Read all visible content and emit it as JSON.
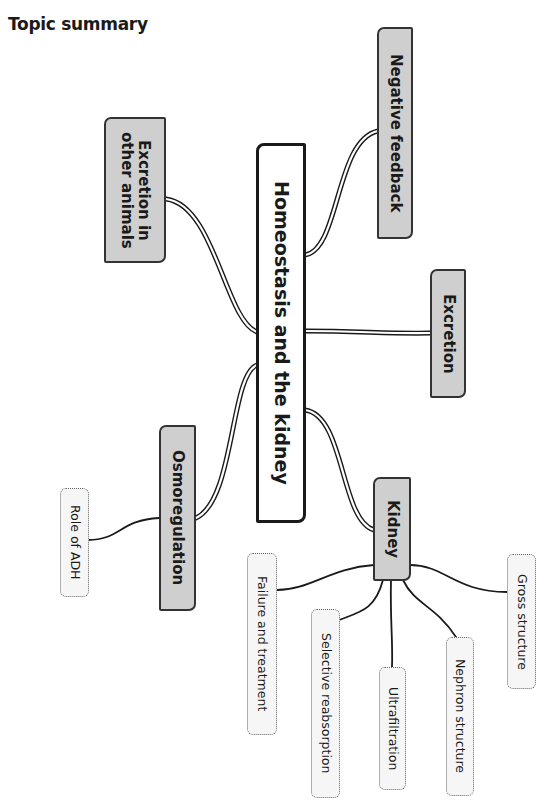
{
  "page": {
    "title": "Topic summary"
  },
  "mindmap": {
    "center": {
      "label": "Homeostasis and the kidney"
    },
    "branches": {
      "negative_feedback": {
        "label": "Negative feedback"
      },
      "excretion_other_animals": {
        "label": "Excretion in other animals",
        "line1": "Excretion in",
        "line2": "other animals"
      },
      "excretion": {
        "label": "Excretion"
      },
      "osmoregulation": {
        "label": "Osmoregulation",
        "children": [
          {
            "label": "Role of ADH"
          }
        ]
      },
      "kidney": {
        "label": "Kidney",
        "children": [
          {
            "label": "Failure and treatment"
          },
          {
            "label": "Selective reabsorption"
          },
          {
            "label": "Ultrafiltration"
          },
          {
            "label": "Nephron structure"
          },
          {
            "label": "Gross structure"
          }
        ]
      }
    }
  },
  "colors": {
    "main_node_fill": "#cfcfcf",
    "leaf_node_fill": "#f6f6f6",
    "stroke": "#1a1a1a"
  }
}
